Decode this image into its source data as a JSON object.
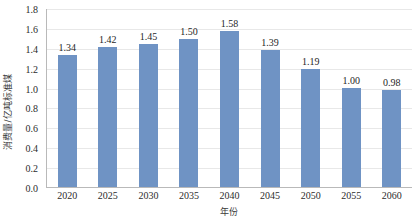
{
  "chart_data": {
    "type": "bar",
    "title": "",
    "xlabel": "年份",
    "ylabel": "消费量/亿吨标准煤",
    "categories": [
      "2020",
      "2025",
      "2030",
      "2035",
      "2040",
      "2045",
      "2050",
      "2055",
      "2060"
    ],
    "values": [
      1.34,
      1.42,
      1.45,
      1.5,
      1.58,
      1.39,
      1.19,
      1.0,
      0.98
    ],
    "value_labels": [
      "1.34",
      "1.42",
      "1.45",
      "1.50",
      "1.58",
      "1.39",
      "1.19",
      "1.00",
      "0.98"
    ],
    "ylim": [
      0.0,
      1.8
    ],
    "ytick_values": [
      0.0,
      0.2,
      0.4,
      0.6,
      0.8,
      1.0,
      1.2,
      1.4,
      1.6,
      1.8
    ],
    "ytick_labels": [
      "0.0",
      "0.2",
      "0.4",
      "0.6",
      "0.8",
      "1.0",
      "1.2",
      "1.4",
      "1.6",
      "1.8"
    ],
    "grid": "horizontal",
    "legend": "none",
    "series": [
      {
        "name": "消费量",
        "values": [
          1.34,
          1.42,
          1.45,
          1.5,
          1.58,
          1.39,
          1.19,
          1.0,
          0.98
        ],
        "color": "#6f93c4"
      }
    ],
    "colors": {
      "bar": "#6f93c4",
      "gridline": "#e8e8e8",
      "axis": "#b9b9b9",
      "text": "#2c2c2c",
      "background": "#ffffff"
    }
  }
}
